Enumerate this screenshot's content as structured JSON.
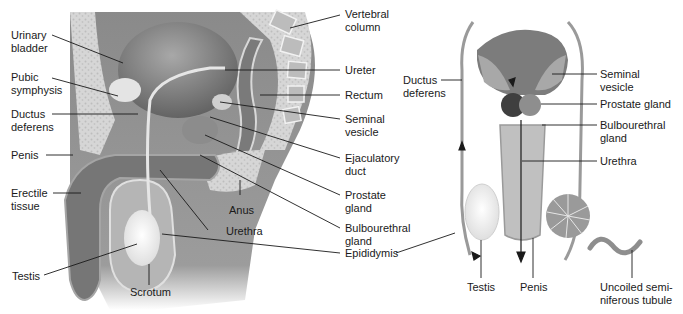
{
  "figure": {
    "left_panel": {
      "view": "sagittal-section",
      "labels": [
        {
          "id": "urinary-bladder",
          "text": "Urinary\nbladder",
          "l1": "Urinary",
          "l2": "bladder"
        },
        {
          "id": "pubic-symphysis",
          "text": "Pubic symphysis",
          "l1": "Pubic",
          "l2": "symphysis"
        },
        {
          "id": "ductus-deferens",
          "text": "Ductus deferens",
          "l1": "Ductus",
          "l2": "deferens"
        },
        {
          "id": "penis",
          "text": "Penis",
          "l1": "Penis"
        },
        {
          "id": "erectile-tissue",
          "text": "Erectile tissue",
          "l1": "Erectile",
          "l2": "tissue"
        },
        {
          "id": "testis",
          "text": "Testis",
          "l1": "Testis"
        },
        {
          "id": "scrotum",
          "text": "Scrotum",
          "l1": "Scrotum"
        },
        {
          "id": "urethra",
          "text": "Urethra",
          "l1": "Urethra"
        },
        {
          "id": "anus",
          "text": "Anus",
          "l1": "Anus"
        },
        {
          "id": "vertebral-column",
          "text": "Vertebral column",
          "l1": "Vertebral",
          "l2": "column"
        },
        {
          "id": "ureter",
          "text": "Ureter",
          "l1": "Ureter"
        },
        {
          "id": "rectum",
          "text": "Rectum",
          "l1": "Rectum"
        },
        {
          "id": "seminal-vesicle",
          "text": "Seminal vesicle",
          "l1": "Seminal",
          "l2": "vesicle"
        },
        {
          "id": "ejaculatory-duct",
          "text": "Ejaculatory duct",
          "l1": "Ejaculatory",
          "l2": "duct"
        },
        {
          "id": "prostate-gland",
          "text": "Prostate gland",
          "l1": "Prostate",
          "l2": "gland"
        },
        {
          "id": "bulbourethral-gland",
          "text": "Bulbourethral gland",
          "l1": "Bulbourethral",
          "l2": "gland"
        },
        {
          "id": "epididymis",
          "text": "Epididymis",
          "l1": "Epididymis"
        }
      ]
    },
    "right_panel": {
      "view": "posterior-view",
      "labels": [
        {
          "id": "ductus-deferens",
          "l1": "Ductus",
          "l2": "deferens"
        },
        {
          "id": "seminal-vesicle",
          "l1": "Seminal",
          "l2": "vesicle"
        },
        {
          "id": "prostate-gland",
          "l1": "Prostate gland"
        },
        {
          "id": "bulbourethral-gland",
          "l1": "Bulbourethral",
          "l2": "gland"
        },
        {
          "id": "urethra",
          "l1": "Urethra"
        },
        {
          "id": "testis",
          "l1": "Testis"
        },
        {
          "id": "penis",
          "l1": "Penis"
        },
        {
          "id": "uncoiled-seminiferous-tubule",
          "l1": "Uncoiled semi-",
          "l2": "niferous tubule"
        }
      ]
    },
    "colors": {
      "ink": "#1a1a1a",
      "tissue_dark": "#6e6e6e",
      "tissue_mid": "#9a9a9a",
      "tissue_light": "#c8c8c8",
      "bone_speckle": "#d9d9d9",
      "testis_white": "#f4f4f4"
    }
  }
}
